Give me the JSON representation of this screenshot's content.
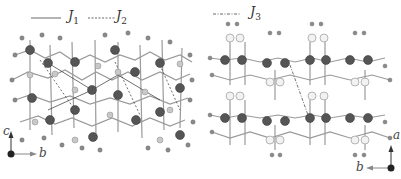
{
  "figure": {
    "left_panel": {
      "legend": [
        {
          "symbol": "solid-line",
          "label": "J",
          "sub": "1"
        },
        {
          "symbol": "dashed-line",
          "label": "J",
          "sub": "2"
        }
      ],
      "axes": {
        "vertical": "c",
        "horizontal": "b"
      }
    },
    "right_panel": {
      "legend": [
        {
          "symbol": "dash-dot-line",
          "label": "J",
          "sub": "3"
        }
      ],
      "axes": {
        "vertical": "a",
        "horizontal": "b"
      }
    },
    "colors": {
      "large_atom": "#555555",
      "small_atom": "#8a8a8a",
      "light_atom": "#d0d0d0",
      "bond": "#9a9a9a"
    }
  }
}
